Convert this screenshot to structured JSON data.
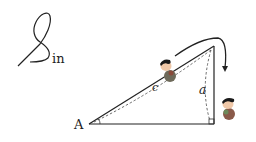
{
  "title": {
    "script_letter": "S",
    "suffix": "in"
  },
  "labels": {
    "vertex_a": "A",
    "hypotenuse": "c",
    "opposite": "a"
  },
  "colors": {
    "stroke": "#222222",
    "figure_shirt": "#8a4a3a",
    "figure_hair": "#1a1a1a",
    "figure_skin": "#f0c8a8",
    "figure_body": "#6e8a5a"
  }
}
